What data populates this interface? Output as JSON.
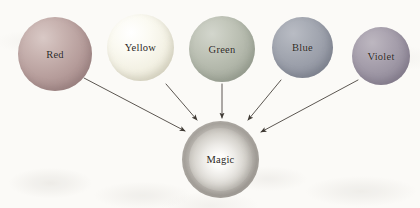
{
  "diagram": {
    "background_color": "#fbfaf7",
    "stroke_color": "#4a443e",
    "text_color": "#2b2723",
    "nodes": [
      {
        "id": "red",
        "label": "Red",
        "color": "#b79e9c",
        "cx": 55,
        "cy": 54,
        "r": 37
      },
      {
        "id": "yellow",
        "label": "Yellow",
        "color": "#f3f1e4",
        "cx": 140,
        "cy": 47,
        "r": 33
      },
      {
        "id": "green",
        "label": "Green",
        "color": "#b2b7aa",
        "cx": 222,
        "cy": 49,
        "r": 33
      },
      {
        "id": "blue",
        "label": "Blue",
        "color": "#9a9ea9",
        "cx": 302,
        "cy": 47,
        "r": 30
      },
      {
        "id": "violet",
        "label": "Violet",
        "color": "#9d96a4",
        "cx": 381,
        "cy": 56,
        "r": 29
      }
    ],
    "target": {
      "id": "magic",
      "label": "Magic",
      "ring_color": "#b9b5af",
      "core_color": "#e8e6e2",
      "cx": 220,
      "cy": 159,
      "outer_r": 38,
      "inner_r": 31
    },
    "edges": [
      {
        "id": "red-to-magic",
        "from": "Red",
        "to": "Magic",
        "x1": 84,
        "y1": 78,
        "x2": 185,
        "y2": 131
      },
      {
        "id": "yellow-to-magic",
        "from": "Yellow",
        "to": "Magic",
        "x1": 166,
        "y1": 84,
        "x2": 197,
        "y2": 120
      },
      {
        "id": "green-to-magic",
        "from": "Green",
        "to": "Magic",
        "x1": 222,
        "y1": 84,
        "x2": 222,
        "y2": 118
      },
      {
        "id": "blue-to-magic",
        "from": "Blue",
        "to": "Magic",
        "x1": 281,
        "y1": 80,
        "x2": 248,
        "y2": 120
      },
      {
        "id": "violet-to-magic",
        "from": "Violet",
        "to": "Magic",
        "x1": 358,
        "y1": 80,
        "x2": 261,
        "y2": 132
      }
    ]
  }
}
